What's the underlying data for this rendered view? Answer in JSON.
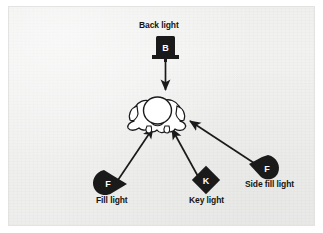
{
  "figure": {
    "type": "lighting-setup-diagram",
    "subject": {
      "name": "animal-subject-top-view",
      "description": "top-down outline of a dog"
    },
    "background_color": "#f2f2f1",
    "ink_color": "#1a1a1a",
    "lamp_letter_color": "#ffffff"
  },
  "lights": [
    {
      "id": "back-light",
      "label": "Back light",
      "letter": "B",
      "shape": "rectangle-on-stand",
      "position": "top-center"
    },
    {
      "id": "fill-light",
      "label": "Fill light",
      "letter": "F",
      "shape": "teardrop-right",
      "position": "bottom-left"
    },
    {
      "id": "key-light",
      "label": "Key light",
      "letter": "K",
      "shape": "diamond",
      "position": "bottom-center"
    },
    {
      "id": "side-fill-light",
      "label": "Side fill light",
      "letter": "F",
      "shape": "teardrop-left",
      "position": "bottom-right"
    }
  ],
  "arrows": [
    {
      "from": "back-light",
      "to": "subject",
      "direction": "down"
    },
    {
      "from": "fill-light",
      "to": "subject",
      "direction": "up-right"
    },
    {
      "from": "key-light",
      "to": "subject",
      "direction": "up-left"
    },
    {
      "from": "side-fill-light",
      "to": "subject",
      "direction": "up-left"
    }
  ]
}
